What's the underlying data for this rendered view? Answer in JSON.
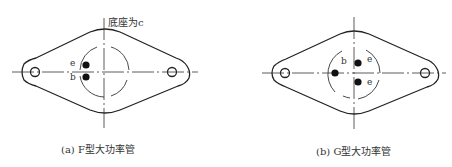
{
  "figures": [
    {
      "id": "a",
      "caption": "(a) F型大功率管",
      "annotation": "底座为c",
      "pins": {
        "e": "e",
        "b": "b"
      }
    },
    {
      "id": "b",
      "caption": "(b) G型大功率管",
      "pins": {
        "b": "b",
        "e1": "e",
        "e2": "e"
      }
    }
  ],
  "colors": {
    "stroke": "#222222",
    "background": "#ffffff"
  }
}
